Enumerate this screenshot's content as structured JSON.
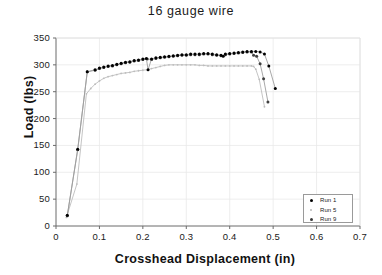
{
  "chart_data": {
    "type": "line",
    "title": "16 gauge wire",
    "xlabel": "Crosshead Displacement  (in)",
    "ylabel": "Load  (lbs)",
    "xlim": [
      0,
      0.7
    ],
    "ylim": [
      0,
      350
    ],
    "xticks": [
      "0",
      "0.1",
      "0.2",
      "0.3",
      "0.4",
      "0.5",
      "0.6",
      "0.7"
    ],
    "xtick_values": [
      0,
      0.1,
      0.2,
      0.3,
      0.4,
      0.5,
      0.6,
      0.7
    ],
    "yticks": [
      "0",
      "50",
      "100",
      "150",
      "200",
      "250",
      "300",
      "350"
    ],
    "ytick_values": [
      0,
      50,
      100,
      150,
      200,
      250,
      300,
      350
    ],
    "grid": true,
    "legend_position": "lower right",
    "series": [
      {
        "name": "Run 1",
        "color": "#000000",
        "marker": "filled-circle",
        "points": [
          [
            0.026,
            20
          ],
          [
            0.05,
            143
          ],
          [
            0.072,
            287
          ],
          [
            0.09,
            291
          ],
          [
            0.1,
            294
          ],
          [
            0.11,
            296
          ],
          [
            0.12,
            298
          ],
          [
            0.13,
            299
          ],
          [
            0.14,
            301
          ],
          [
            0.15,
            303
          ],
          [
            0.16,
            305
          ],
          [
            0.17,
            306
          ],
          [
            0.18,
            308
          ],
          [
            0.19,
            309
          ],
          [
            0.2,
            311
          ],
          [
            0.208,
            312
          ],
          [
            0.212,
            291
          ],
          [
            0.22,
            311
          ],
          [
            0.23,
            313
          ],
          [
            0.24,
            314
          ],
          [
            0.25,
            315
          ],
          [
            0.26,
            316
          ],
          [
            0.27,
            317
          ],
          [
            0.28,
            318
          ],
          [
            0.29,
            319
          ],
          [
            0.3,
            319
          ],
          [
            0.31,
            320
          ],
          [
            0.32,
            320
          ],
          [
            0.33,
            320
          ],
          [
            0.34,
            321
          ],
          [
            0.35,
            321
          ],
          [
            0.36,
            320
          ],
          [
            0.37,
            319
          ],
          [
            0.38,
            318
          ],
          [
            0.385,
            316
          ],
          [
            0.39,
            320
          ],
          [
            0.4,
            321
          ],
          [
            0.41,
            322
          ],
          [
            0.42,
            323
          ],
          [
            0.43,
            324
          ],
          [
            0.44,
            325
          ],
          [
            0.45,
            325
          ],
          [
            0.46,
            325
          ],
          [
            0.47,
            324
          ],
          [
            0.48,
            320
          ],
          [
            0.49,
            298
          ],
          [
            0.505,
            256
          ]
        ]
      },
      {
        "name": "Run 5",
        "color": "#bdbdbd",
        "marker": "small-dot",
        "points": [
          [
            0.024,
            16
          ],
          [
            0.048,
            78
          ],
          [
            0.07,
            246
          ],
          [
            0.08,
            256
          ],
          [
            0.09,
            264
          ],
          [
            0.1,
            270
          ],
          [
            0.11,
            275
          ],
          [
            0.12,
            278
          ],
          [
            0.13,
            280
          ],
          [
            0.14,
            282
          ],
          [
            0.15,
            284
          ],
          [
            0.16,
            285
          ],
          [
            0.17,
            286
          ],
          [
            0.18,
            288
          ],
          [
            0.19,
            289
          ],
          [
            0.2,
            290
          ],
          [
            0.21,
            291
          ],
          [
            0.22,
            293
          ],
          [
            0.23,
            295
          ],
          [
            0.24,
            297
          ],
          [
            0.25,
            299
          ],
          [
            0.26,
            300
          ],
          [
            0.27,
            300
          ],
          [
            0.28,
            300
          ],
          [
            0.29,
            300
          ],
          [
            0.3,
            300
          ],
          [
            0.31,
            300
          ],
          [
            0.32,
            300
          ],
          [
            0.33,
            299
          ],
          [
            0.34,
            299
          ],
          [
            0.35,
            298
          ],
          [
            0.36,
            298
          ],
          [
            0.37,
            298
          ],
          [
            0.38,
            298
          ],
          [
            0.39,
            298
          ],
          [
            0.4,
            298
          ],
          [
            0.41,
            298
          ],
          [
            0.42,
            298
          ],
          [
            0.43,
            298
          ],
          [
            0.44,
            298
          ],
          [
            0.45,
            298
          ],
          [
            0.455,
            297
          ],
          [
            0.46,
            292
          ],
          [
            0.468,
            273
          ],
          [
            0.48,
            222
          ]
        ]
      },
      {
        "name": "Run 9",
        "color": "#3f3f3f",
        "marker": "filled-circle",
        "points": [
          [
            0.026,
            19
          ],
          [
            0.05,
            142
          ],
          [
            0.072,
            287
          ],
          [
            0.09,
            290
          ],
          [
            0.1,
            293
          ],
          [
            0.11,
            295
          ],
          [
            0.12,
            297
          ],
          [
            0.13,
            298
          ],
          [
            0.14,
            300
          ],
          [
            0.15,
            302
          ],
          [
            0.16,
            304
          ],
          [
            0.17,
            305
          ],
          [
            0.18,
            307
          ],
          [
            0.19,
            308
          ],
          [
            0.2,
            310
          ],
          [
            0.21,
            311
          ],
          [
            0.22,
            310
          ],
          [
            0.23,
            312
          ],
          [
            0.24,
            313
          ],
          [
            0.25,
            314
          ],
          [
            0.26,
            315
          ],
          [
            0.27,
            316
          ],
          [
            0.28,
            317
          ],
          [
            0.29,
            318
          ],
          [
            0.3,
            318
          ],
          [
            0.31,
            319
          ],
          [
            0.32,
            319
          ],
          [
            0.33,
            319
          ],
          [
            0.34,
            320
          ],
          [
            0.35,
            320
          ],
          [
            0.36,
            319
          ],
          [
            0.37,
            318
          ],
          [
            0.38,
            317
          ],
          [
            0.39,
            319
          ],
          [
            0.4,
            320
          ],
          [
            0.41,
            321
          ],
          [
            0.42,
            322
          ],
          [
            0.43,
            323
          ],
          [
            0.44,
            324
          ],
          [
            0.45,
            324
          ],
          [
            0.455,
            318
          ],
          [
            0.462,
            316
          ],
          [
            0.47,
            302
          ],
          [
            0.478,
            274
          ],
          [
            0.488,
            231
          ]
        ]
      }
    ]
  },
  "legend": {
    "entries": [
      {
        "label": "Run 1"
      },
      {
        "label": "Run 5"
      },
      {
        "label": "Run 9"
      }
    ]
  }
}
